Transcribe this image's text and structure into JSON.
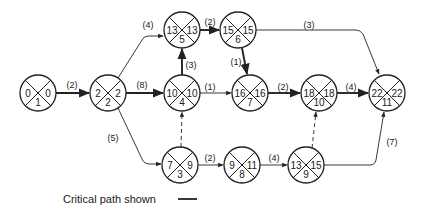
{
  "diagram": {
    "type": "activity-on-arrow network (CPM)",
    "node_format": "left = earliest time, right = latest time, bottom = event number",
    "nodes": [
      {
        "id": 1,
        "early": "0",
        "late": "0",
        "event": "1",
        "x": 38,
        "y": 93
      },
      {
        "id": 2,
        "early": "2",
        "late": "2",
        "event": "2",
        "x": 108,
        "y": 93
      },
      {
        "id": 3,
        "early": "7",
        "late": "9",
        "event": "3",
        "x": 180,
        "y": 165
      },
      {
        "id": 4,
        "early": "10",
        "late": "10",
        "event": "4",
        "x": 182,
        "y": 93
      },
      {
        "id": 5,
        "early": "13",
        "late": "13",
        "event": "5",
        "x": 182,
        "y": 30
      },
      {
        "id": 6,
        "early": "15",
        "late": "15",
        "event": "6",
        "x": 238,
        "y": 30
      },
      {
        "id": 7,
        "early": "16",
        "late": "16",
        "event": "7",
        "x": 250,
        "y": 93
      },
      {
        "id": 8,
        "early": "9",
        "late": "11",
        "event": "8",
        "x": 242,
        "y": 165
      },
      {
        "id": 9,
        "early": "13",
        "late": "15",
        "event": "9",
        "x": 306,
        "y": 165
      },
      {
        "id": 10,
        "early": "18",
        "late": "18",
        "event": "10",
        "x": 319,
        "y": 93
      },
      {
        "id": 11,
        "early": "22",
        "late": "22",
        "event": "11",
        "x": 387,
        "y": 93
      }
    ],
    "edges": [
      {
        "from": 1,
        "to": 2,
        "duration": "(2)",
        "kind": "critical"
      },
      {
        "from": 2,
        "to": 5,
        "duration": "(4)",
        "kind": "normal"
      },
      {
        "from": 2,
        "to": 4,
        "duration": "(8)",
        "kind": "critical"
      },
      {
        "from": 2,
        "to": 3,
        "duration": "(5)",
        "kind": "normal"
      },
      {
        "from": 4,
        "to": 5,
        "duration": "(3)",
        "kind": "critical"
      },
      {
        "from": 5,
        "to": 6,
        "duration": "(2)",
        "kind": "critical"
      },
      {
        "from": 6,
        "to": 7,
        "duration": "(1)",
        "kind": "critical"
      },
      {
        "from": 6,
        "to": 11,
        "duration": "(3)",
        "kind": "normal"
      },
      {
        "from": 4,
        "to": 7,
        "duration": "(1)",
        "kind": "normal"
      },
      {
        "from": 7,
        "to": 10,
        "duration": "(2)",
        "kind": "critical"
      },
      {
        "from": 10,
        "to": 11,
        "duration": "(4)",
        "kind": "critical"
      },
      {
        "from": 3,
        "to": 4,
        "duration": "",
        "kind": "dummy"
      },
      {
        "from": 3,
        "to": 8,
        "duration": "(2)",
        "kind": "normal"
      },
      {
        "from": 8,
        "to": 9,
        "duration": "(4)",
        "kind": "normal"
      },
      {
        "from": 9,
        "to": 10,
        "duration": "",
        "kind": "dummy"
      },
      {
        "from": 9,
        "to": 11,
        "duration": "(7)",
        "kind": "normal"
      }
    ],
    "labels": {
      "e1_2": "(2)",
      "e2_5": "(4)",
      "e2_4": "(8)",
      "e2_3": "(5)",
      "e4_5": "(3)",
      "e5_6": "(2)",
      "e6_7": "(1)",
      "e6_11": "(3)",
      "e4_7": "(1)",
      "e7_10": "(2)",
      "e10_11": "(4)",
      "e3_8": "(2)",
      "e8_9": "(4)",
      "e9_11": "(7)"
    },
    "legend": {
      "text": "Critical path shown"
    }
  }
}
